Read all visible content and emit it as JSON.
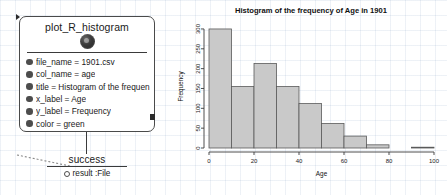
{
  "workflow": {
    "node": {
      "title": "plot_R_histogram",
      "icon": "r-logo-icon",
      "in_port": "input-port",
      "out_port": "output-port",
      "params": [
        {
          "label": "file_name = 1901.csv"
        },
        {
          "label": "col_name = age"
        },
        {
          "label": "title = Histogram of the frequen"
        },
        {
          "label": "x_label = Age"
        },
        {
          "label": "y_label = Frequency"
        },
        {
          "label": "color = green"
        }
      ]
    },
    "success_node": {
      "title": "success",
      "result_label": "result :File"
    }
  },
  "chart_data": {
    "type": "bar",
    "title": "Histogram of the frequency of Age in 1901",
    "xlabel": "Age",
    "ylabel": "Frequency",
    "grid": false,
    "legend": "none",
    "xlim": [
      0,
      100
    ],
    "ylim": [
      0,
      310
    ],
    "xticks": [
      0,
      20,
      40,
      60,
      80,
      100
    ],
    "yticks": [
      0,
      50,
      100,
      150,
      200,
      250,
      300
    ],
    "bin_width": 10,
    "bin_edges": [
      0,
      10,
      20,
      30,
      40,
      50,
      60,
      70,
      80,
      90,
      100
    ],
    "categories": [
      "0-10",
      "10-20",
      "20-30",
      "30-40",
      "40-50",
      "50-60",
      "60-70",
      "70-80",
      "80-90",
      "90-100"
    ],
    "values": [
      300,
      155,
      213,
      155,
      112,
      62,
      30,
      8,
      0,
      2
    ],
    "bar_color": "#c9c9c9",
    "bar_edge_color": "#5a5a5a"
  }
}
